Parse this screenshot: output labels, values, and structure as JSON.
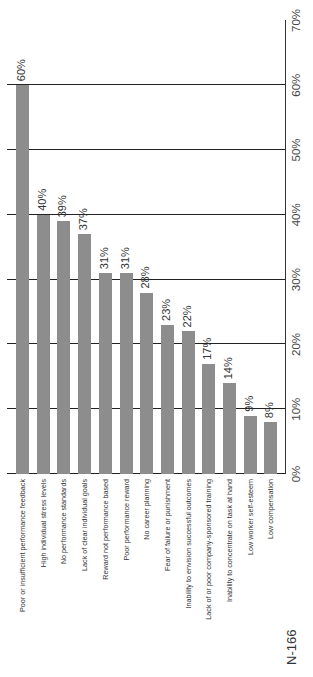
{
  "chart_data": {
    "type": "bar",
    "orientation": "vertical (figure rotated 90° counter-clockwise)",
    "title": "",
    "xlabel": "",
    "ylabel": "",
    "ylim": [
      0,
      70
    ],
    "ytick_labels": [
      "0%",
      "10%",
      "20%",
      "30%",
      "40%",
      "50%",
      "60%",
      "70%"
    ],
    "grid": true,
    "categories": [
      "Poor or insufficient performance feedback",
      "High individual stress levels",
      "No performance standards",
      "Lack of clear individual goals",
      "Reward not performance based",
      "Poor performance reward",
      "No career planning",
      "Fear of failure or punishment",
      "Inability to envision successful outcomes",
      "Lack of or poor company-sponsored training",
      "Inability to concentrate on task at hand",
      "Low worker self-esteem",
      "Low compensation"
    ],
    "values": [
      60,
      40,
      39,
      37,
      31,
      31,
      28,
      23,
      22,
      17,
      14,
      9,
      8
    ],
    "value_labels": [
      "60%",
      "40%",
      "39%",
      "37%",
      "31%",
      "31%",
      "28%",
      "23%",
      "22%",
      "17%",
      "14%",
      "9%",
      "8%"
    ],
    "annotation": "N-166",
    "bar_color": "#8d8d8d"
  }
}
